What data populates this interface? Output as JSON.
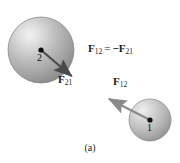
{
  "figure": {
    "caption": "(a)",
    "background_color": "#ffffff",
    "width": 180,
    "height": 163
  },
  "bodies": [
    {
      "label": "2",
      "name": "sphere-2",
      "cx": 41,
      "cy": 50,
      "r": 33,
      "highlight_color": "#ebebeb",
      "mid_color": "#b4b4b4",
      "edge_color": "#8c8c8c"
    },
    {
      "label": "1",
      "name": "sphere-1",
      "cx": 150,
      "cy": 120,
      "r": 21,
      "highlight_color": "#ebebeb",
      "mid_color": "#b8b8b8",
      "edge_color": "#949494"
    }
  ],
  "vectors": [
    {
      "name": "force-21",
      "symbol": "F",
      "subscript": "21",
      "from_x": 41,
      "from_y": 50,
      "to_x": 75,
      "to_y": 79,
      "color": "#4a4a4a",
      "label_x": 58,
      "label_y": 80
    },
    {
      "name": "force-12",
      "symbol": "F",
      "subscript": "12",
      "from_x": 150,
      "from_y": 120,
      "to_x": 105,
      "to_y": 97,
      "color": "#8a8a8a",
      "label_x": 113,
      "label_y": 80
    }
  ],
  "equation": {
    "lhs_symbol": "F",
    "lhs_subscript": "12",
    "operator": "=",
    "sign": "−",
    "rhs_symbol": "F",
    "rhs_subscript": "21",
    "x": 88,
    "y": 43
  }
}
